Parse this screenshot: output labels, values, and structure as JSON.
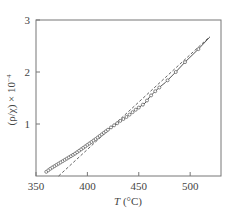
{
  "chart_data": {
    "type": "line",
    "title": "",
    "xlabel": "T (°C)",
    "xlabel_italic": "T",
    "xlabel_unit": " (°C)",
    "ylabel": "(ρ/χ) × 10⁻⁴",
    "ylabel_main": "(ρ/χ) × 10",
    "ylabel_exp": "−4",
    "xlim": [
      350,
      530
    ],
    "ylim": [
      0,
      3
    ],
    "xticks": [
      350,
      400,
      450,
      500
    ],
    "yticks": [
      1,
      2,
      3
    ],
    "grid": false,
    "legend": null,
    "series": [
      {
        "name": "measured",
        "style": "solid-with-open-circles",
        "color": "#555555",
        "x": [
          360,
          364,
          368,
          373,
          378,
          383,
          388,
          393,
          398,
          403,
          408,
          412,
          416,
          420,
          424,
          428,
          432,
          437,
          441,
          446,
          451,
          456,
          461,
          466,
          471,
          476,
          486,
          495,
          508,
          519
        ],
        "y": [
          0.08,
          0.14,
          0.19,
          0.25,
          0.31,
          0.37,
          0.43,
          0.5,
          0.57,
          0.64,
          0.71,
          0.77,
          0.83,
          0.89,
          0.95,
          1.0,
          1.06,
          1.12,
          1.18,
          1.26,
          1.33,
          1.4,
          1.53,
          1.63,
          1.72,
          1.8,
          2.0,
          2.19,
          2.44,
          2.67
        ]
      },
      {
        "name": "linear asymptote",
        "style": "dashed",
        "color": "#555555",
        "x": [
          372,
          519
        ],
        "y": [
          0.0,
          2.68
        ]
      }
    ],
    "marker_points_x": [
      360,
      362,
      364,
      366,
      368,
      370,
      372,
      374,
      376,
      378,
      380,
      382,
      384,
      386,
      388,
      390,
      392,
      394,
      396,
      398,
      400,
      402,
      404,
      406,
      408,
      410,
      412,
      414,
      416,
      418,
      420,
      423,
      426,
      429,
      432,
      435,
      438,
      441,
      444,
      447,
      450,
      454,
      458,
      462,
      466,
      470,
      478,
      486,
      495,
      508
    ],
    "frame": {
      "left": 36,
      "top": 20,
      "right": 221,
      "bottom": 176
    }
  }
}
